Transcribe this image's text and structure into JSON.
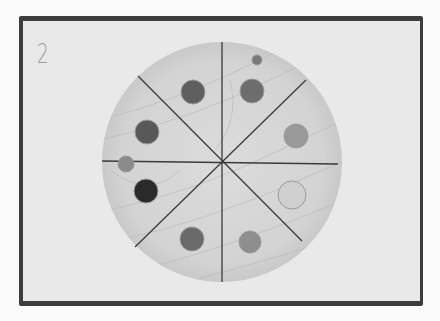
{
  "photo": {
    "label": "2",
    "description": "Wooden disc divided into 8 sectors with colored dots",
    "disc": {
      "cx": 222,
      "cy": 162,
      "r": 120
    },
    "colors": {
      "frame": "#3d3d3d",
      "background": "#e9e9e9",
      "wood": "#d7d7d7",
      "lines": "#3a3a3a"
    },
    "sectors": 8,
    "dots": [
      {
        "x": 193,
        "y": 92,
        "r": 12,
        "shade": "#5f5f5f"
      },
      {
        "x": 252,
        "y": 91,
        "r": 12,
        "shade": "#6d6d6d"
      },
      {
        "x": 257,
        "y": 60,
        "r": 5,
        "shade": "#7a7a7a"
      },
      {
        "x": 147,
        "y": 132,
        "r": 12,
        "shade": "#585858"
      },
      {
        "x": 296,
        "y": 136,
        "r": 12,
        "shade": "#999999"
      },
      {
        "x": 126,
        "y": 164,
        "r": 8,
        "shade": "#8a8a8a"
      },
      {
        "x": 146,
        "y": 191,
        "r": 12,
        "shade": "#2a2a2a"
      },
      {
        "x": 292,
        "y": 195,
        "r": 14,
        "shade": "#d0d0d0"
      },
      {
        "x": 192,
        "y": 239,
        "r": 12,
        "shade": "#6a6a6a"
      },
      {
        "x": 250,
        "y": 242,
        "r": 11,
        "shade": "#8e8e8e"
      }
    ]
  }
}
